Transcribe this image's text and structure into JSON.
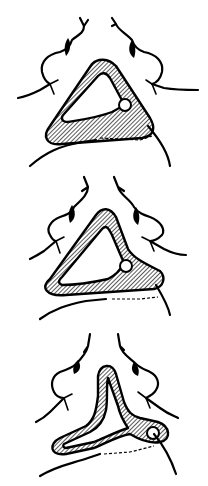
{
  "figure": {
    "panel_count": 3,
    "panels": [
      {
        "label": "",
        "loop_shape": "triangular"
      },
      {
        "label": "",
        "loop_shape": "narrowed"
      },
      {
        "label": "",
        "loop_shape": "elongated"
      }
    ],
    "colors": {
      "ink": "#000000",
      "background": "#ffffff"
    }
  }
}
